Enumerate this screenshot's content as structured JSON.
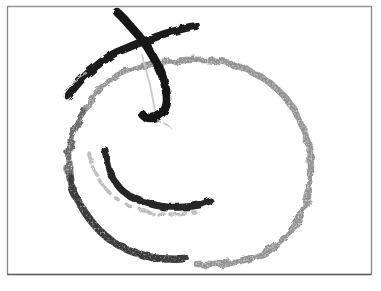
{
  "image": {
    "type": "hand-drawn crayon sketch",
    "description": "Large irregular grainy circle with a bold X mark crossing its top edge (one arm hooking down into the circle like a J) and a curved smile-like stroke inside with a lighter echo stroke beneath it",
    "background_color": "#ffffff",
    "canvas": {
      "width": 381,
      "height": 291
    }
  },
  "frame": {
    "sides": [
      {
        "name": "frame-border-top",
        "x1": 7,
        "y1": 6.5,
        "x2": 371.5,
        "y2": 6.5,
        "color": "#959595",
        "width": 1.3
      },
      {
        "name": "frame-border-right",
        "x1": 371.5,
        "y1": 6,
        "x2": 371.5,
        "y2": 274.5,
        "color": "#8a8a8a",
        "width": 1.3
      },
      {
        "name": "frame-border-bottom",
        "x1": 7,
        "y1": 274.5,
        "x2": 371.5,
        "y2": 274.5,
        "color": "#555555",
        "width": 1.6
      },
      {
        "name": "frame-border-left",
        "x1": 7.5,
        "y1": 6,
        "x2": 7.5,
        "y2": 274.5,
        "color": "#848484",
        "width": 1.3
      }
    ]
  },
  "drawing": {
    "strokes": [
      {
        "name": "circle-outline-gray",
        "color": "#8d8d8d",
        "width": 6.5,
        "opacity": 0.95,
        "texture": "gray",
        "points": [
          [
            84,
            112
          ],
          [
            90,
            101
          ],
          [
            99,
            90
          ],
          [
            110,
            81
          ],
          [
            122,
            73
          ],
          [
            136,
            68
          ],
          [
            151,
            64
          ],
          [
            168,
            62
          ],
          [
            186,
            60
          ],
          [
            204,
            60
          ],
          [
            222,
            62
          ],
          [
            240,
            67
          ],
          [
            256,
            74
          ],
          [
            271,
            84
          ],
          [
            284,
            96
          ],
          [
            295,
            111
          ],
          [
            303,
            128
          ],
          [
            309,
            147
          ],
          [
            311,
            166
          ],
          [
            310,
            186
          ],
          [
            305,
            206
          ],
          [
            296,
            224
          ],
          [
            283,
            240
          ],
          [
            267,
            252
          ],
          [
            248,
            259
          ],
          [
            228,
            263
          ],
          [
            210,
            264
          ],
          [
            197,
            264
          ]
        ]
      },
      {
        "name": "circle-outline-left",
        "color": "#616161",
        "width": 7,
        "opacity": 0.95,
        "texture": "gray",
        "points": [
          [
            84,
            112
          ],
          [
            77,
            124
          ],
          [
            72,
            136
          ],
          [
            69,
            150
          ],
          [
            69,
            163
          ],
          [
            69,
            172
          ],
          [
            70,
            179
          ]
        ]
      },
      {
        "name": "circle-outline-bottom-left",
        "color": "#3d3d3d",
        "width": 7.5,
        "opacity": 1,
        "texture": "charcoal",
        "points": [
          [
            70,
            177
          ],
          [
            73,
            191
          ],
          [
            80,
            204
          ],
          [
            88,
            217
          ],
          [
            99,
            230
          ],
          [
            112,
            241
          ],
          [
            126,
            249
          ],
          [
            140,
            254
          ],
          [
            155,
            258
          ],
          [
            169,
            259
          ],
          [
            180,
            259
          ],
          [
            185,
            258
          ]
        ]
      },
      {
        "name": "cross-stroke-left",
        "color": "#1f1f1f",
        "width": 8,
        "opacity": 1,
        "texture": "dark",
        "points": [
          [
            68,
            96
          ],
          [
            75,
            87
          ],
          [
            84,
            77
          ],
          [
            94,
            68
          ],
          [
            104,
            60
          ],
          [
            115,
            53
          ],
          [
            127,
            48
          ],
          [
            139,
            43
          ],
          [
            151,
            39
          ],
          [
            164,
            34
          ],
          [
            178,
            30
          ],
          [
            190,
            27
          ],
          [
            196,
            26
          ]
        ]
      },
      {
        "name": "cross-stroke-right-hook",
        "color": "#191919",
        "width": 8.5,
        "opacity": 1,
        "texture": "dark",
        "points": [
          [
            117,
            12
          ],
          [
            124,
            19
          ],
          [
            131,
            27
          ],
          [
            139,
            36
          ],
          [
            146,
            45
          ],
          [
            152,
            55
          ],
          [
            158,
            66
          ],
          [
            163,
            78
          ],
          [
            166,
            90
          ],
          [
            167,
            101
          ],
          [
            165,
            109
          ],
          [
            160,
            115
          ],
          [
            152,
            118
          ],
          [
            145,
            117
          ],
          [
            142,
            114
          ]
        ]
      },
      {
        "name": "inner-curve",
        "color": "#262626",
        "width": 7,
        "opacity": 1,
        "texture": "dark",
        "points": [
          [
            105,
            150
          ],
          [
            107,
            160
          ],
          [
            110,
            172
          ],
          [
            116,
            183
          ],
          [
            124,
            192
          ],
          [
            136,
            199
          ],
          [
            151,
            204
          ],
          [
            167,
            207
          ],
          [
            184,
            207
          ],
          [
            199,
            205
          ],
          [
            210,
            201
          ]
        ]
      },
      {
        "name": "inner-curve-echo",
        "color": "#b2b2b2",
        "width": 3.5,
        "opacity": 0.9,
        "texture": "gray",
        "dash": "12 5 7 6 16 7 5 9 4 11",
        "points": [
          [
            88,
            152
          ],
          [
            92,
            164
          ],
          [
            97,
            176
          ],
          [
            105,
            188
          ],
          [
            116,
            198
          ],
          [
            130,
            206
          ],
          [
            145,
            211
          ],
          [
            160,
            214
          ],
          [
            173,
            214
          ],
          [
            185,
            213
          ],
          [
            195,
            212
          ]
        ]
      },
      {
        "name": "guideline-faint",
        "color": "#c4c4c4",
        "width": 1.8,
        "opacity": 0.9,
        "texture": "none",
        "points": [
          [
            142,
            55
          ],
          [
            146,
            70
          ],
          [
            150,
            85
          ],
          [
            153,
            100
          ],
          [
            155,
            110
          ]
        ]
      },
      {
        "name": "scratch-upper-left",
        "color": "#bdbdbd",
        "width": 2.2,
        "opacity": 0.9,
        "texture": "gray",
        "points": [
          [
            65,
            90
          ],
          [
            71,
            83
          ],
          [
            79,
            77
          ],
          [
            86,
            73
          ]
        ]
      },
      {
        "name": "flecks-below-hook",
        "color": "#b5b5b5",
        "width": 2.4,
        "opacity": 0.85,
        "texture": "gray",
        "dash": "4 5",
        "points": [
          [
            157,
            120
          ],
          [
            164,
            124
          ],
          [
            170,
            127
          ]
        ]
      }
    ]
  }
}
